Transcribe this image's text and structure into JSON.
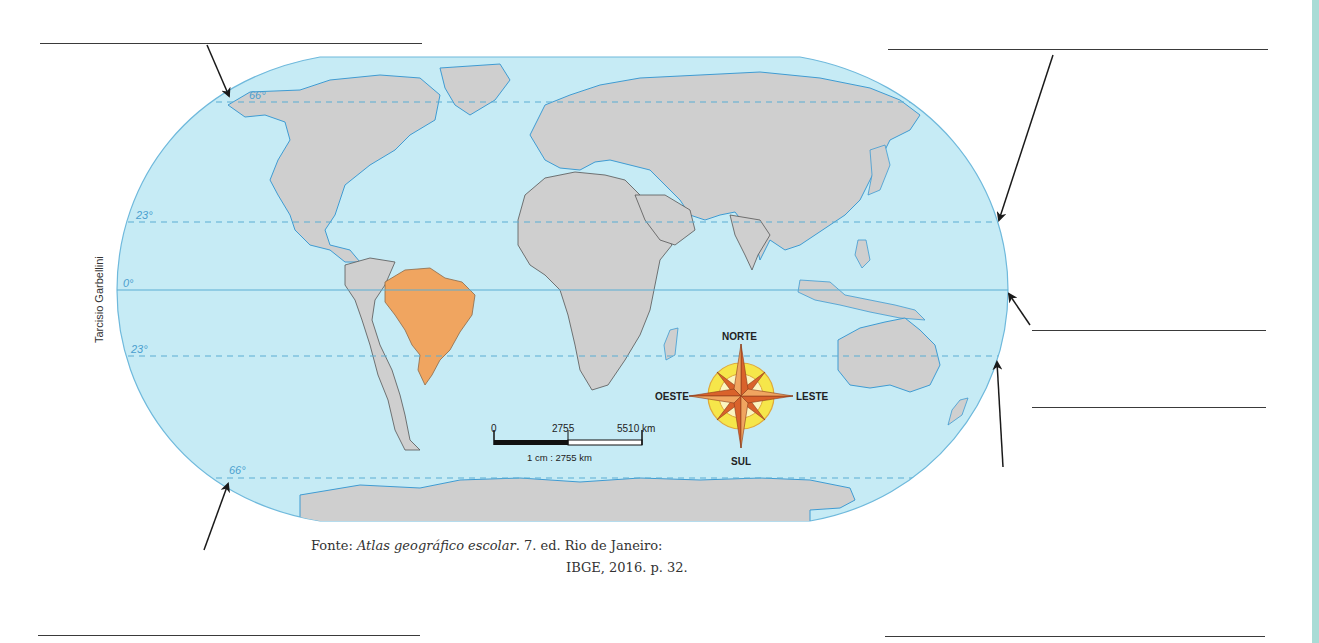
{
  "map": {
    "credit": "Tarcisio Garbellini",
    "highlighted_country": "Brasil",
    "colors": {
      "ocean": "#c6ebf5",
      "land": "#cfcfcf",
      "highlight": "#f0a560",
      "graticule": "#5aaed3",
      "border": "#555555",
      "coast": "#3f9bd2",
      "side_strip": "#a9dcd6"
    },
    "latitude_labels": [
      {
        "id": "arctic-circle",
        "label": "66°"
      },
      {
        "id": "tropic-of-cancer",
        "label": "23°"
      },
      {
        "id": "equator",
        "label": "0°"
      },
      {
        "id": "tropic-of-capricorn",
        "label": "23°"
      },
      {
        "id": "antarctic-circle",
        "label": "66°"
      }
    ],
    "scale_bar": {
      "ticks": [
        "0",
        "2755",
        "5510 km"
      ],
      "ratio": "1 cm : 2755 km"
    },
    "compass": {
      "north": "NORTE",
      "south": "SUL",
      "east": "LESTE",
      "west": "OESTE"
    }
  },
  "source": {
    "prefix": "Fonte: ",
    "title": "Atlas geográfico escolar",
    "rest_line1": ". 7. ed. Rio de Janeiro:",
    "line2": "IBGE, 2016. p. 32."
  },
  "answer_blanks": [
    {
      "id": "blank-top-left",
      "points_to": "66° N"
    },
    {
      "id": "blank-top-right",
      "points_to": "23° N"
    },
    {
      "id": "blank-right-middle",
      "points_to": "0°"
    },
    {
      "id": "blank-right-lower",
      "points_to": "23° S"
    },
    {
      "id": "blank-bottom-right",
      "points_to": "23° S"
    },
    {
      "id": "blank-bottom-left",
      "points_to": "66° S"
    }
  ]
}
